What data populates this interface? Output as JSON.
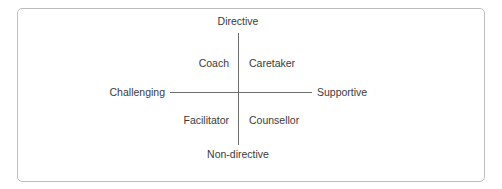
{
  "chart_data": {
    "type": "scatter",
    "title": "",
    "xlabel": "",
    "ylabel": "",
    "grid": false,
    "legend": null,
    "axes": {
      "vertical": {
        "top_label": "Directive",
        "bottom_label": "Non-directive"
      },
      "horizontal": {
        "left_label": "Challenging",
        "right_label": "Supportive"
      }
    },
    "quadrants": [
      {
        "position": "top-left",
        "label": "Coach"
      },
      {
        "position": "top-right",
        "label": "Caretaker"
      },
      {
        "position": "bottom-left",
        "label": "Facilitator"
      },
      {
        "position": "bottom-right",
        "label": "Counsellor"
      }
    ],
    "colors": {
      "axis": "#6e6e6e",
      "text": "#3a3a3a",
      "border": "#bdbdbd",
      "background": "#ffffff"
    }
  }
}
